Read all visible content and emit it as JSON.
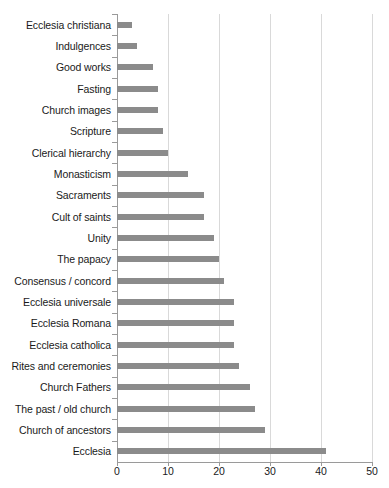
{
  "chart_data": {
    "type": "bar",
    "orientation": "horizontal",
    "title": "",
    "xlabel": "",
    "ylabel": "",
    "xlim": [
      0,
      50
    ],
    "xticks": [
      0,
      10,
      20,
      30,
      40,
      50
    ],
    "grid": true,
    "legend": false,
    "bar_color": "#8b8b8b",
    "gridline_color": "#d9d9d9",
    "axis_color": "#9a9a9a",
    "categories": [
      "Ecclesia christiana",
      "Indulgences",
      "Good works",
      "Fasting",
      "Church images",
      "Scripture",
      "Clerical hierarchy",
      "Monasticism",
      "Sacraments",
      "Cult of saints",
      "Unity",
      "The papacy",
      "Consensus / concord",
      "Ecclesia universale",
      "Ecclesia Romana",
      "Ecclesia catholica",
      "Rites and ceremonies",
      "Church Fathers",
      "The past / old church",
      "Church of ancestors",
      "Ecclesia"
    ],
    "values": [
      3,
      4,
      7,
      8,
      8,
      9,
      10,
      14,
      17,
      17,
      19,
      20,
      21,
      23,
      23,
      23,
      24,
      26,
      27,
      29,
      41
    ]
  }
}
